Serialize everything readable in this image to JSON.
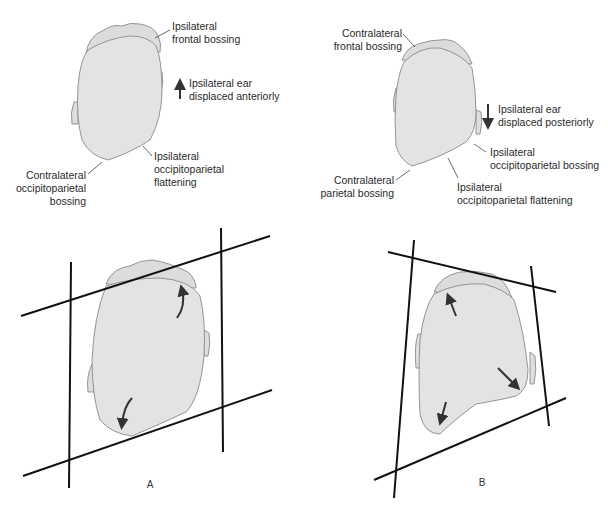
{
  "figure": {
    "panel_a": {
      "label": "A",
      "top_labels": {
        "ipsilateral_frontal_bossing": [
          "Ipsilateral",
          "frontal bossing"
        ],
        "ear_displacement": [
          "Ipsilateral ear",
          "displaced anteriorly"
        ],
        "ipsilateral_occipitoparietal_flattening": [
          "Ipsilateral",
          "occipitoparietal",
          "flattening"
        ],
        "contralateral_occipitoparietal_bossing": [
          "Contralateral",
          "occipitoparietal",
          "bossing"
        ]
      },
      "ear_arrow_direction": "up",
      "bottom_shape": "parallelogram"
    },
    "panel_b": {
      "label": "B",
      "top_labels": {
        "contralateral_frontal_bossing": [
          "Contralateral",
          "frontal bossing"
        ],
        "ear_displacement": [
          "Ipsilateral ear",
          "displaced posteriorly"
        ],
        "ipsilateral_occipitoparietal_bossing": [
          "Ipsilateral",
          "occipitoparietal bossing"
        ],
        "contralateral_parietal_bossing": [
          "Contralateral",
          "parietal bossing"
        ],
        "ipsilateral_occipitoparietal_flattening": [
          "Ipsilateral",
          "occipitoparietal flattening"
        ]
      },
      "ear_arrow_direction": "down",
      "bottom_shape": "trapezoid"
    },
    "colors": {
      "head_fill": "#e3e3e3",
      "outline": "#8a8a8a",
      "lines": "#111111",
      "text": "#2a2a2a"
    }
  }
}
